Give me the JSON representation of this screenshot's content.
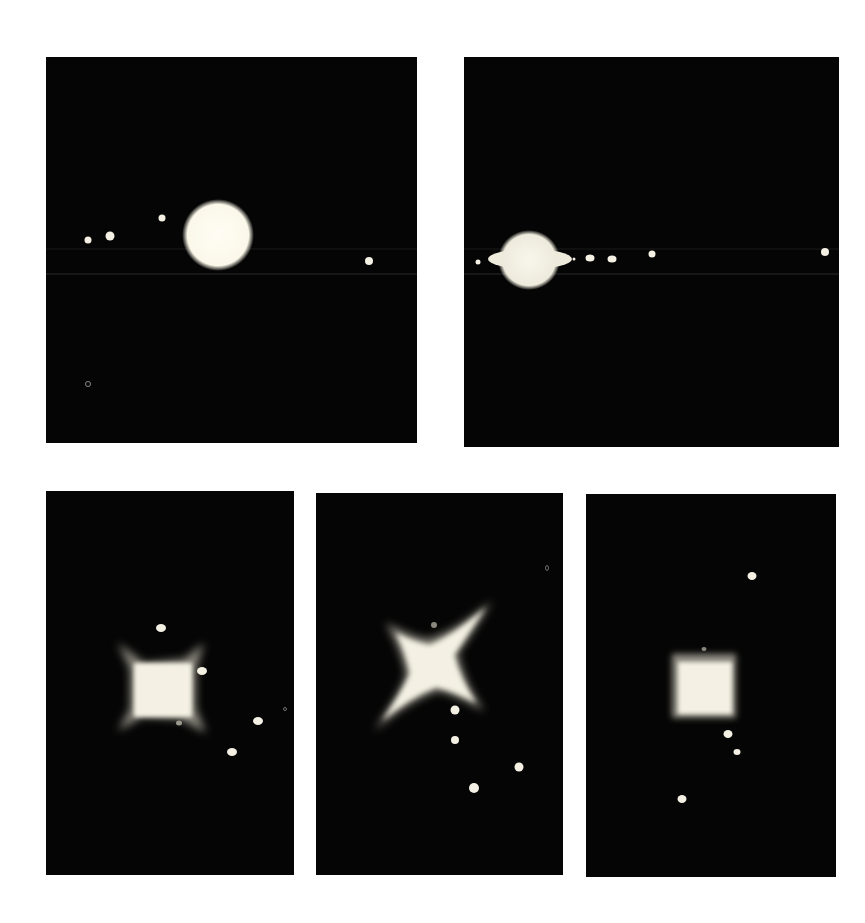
{
  "figure": {
    "background": "#ffffff",
    "panel_color": "#050505",
    "panels": [
      {
        "id": "top-left",
        "shape": "disk",
        "box": {
          "x": 46,
          "y": 57,
          "w": 371,
          "h": 386
        },
        "main_object": {
          "cx": 172,
          "cy": 178,
          "r": 33
        },
        "moons": [
          [
            42,
            183,
            3.5
          ],
          [
            64,
            179,
            4.5
          ],
          [
            116,
            161,
            3.5
          ],
          [
            323,
            204,
            4
          ]
        ],
        "scanlines": [
          192,
          217
        ]
      },
      {
        "id": "top-right",
        "shape": "ringed-planet",
        "box": {
          "x": 464,
          "y": 57,
          "w": 375,
          "h": 390
        },
        "main_object": {
          "cx": 63,
          "cy": 203
        },
        "moons": [
          [
            14,
            205,
            2.5
          ],
          [
            110,
            202,
            1.5
          ],
          [
            126,
            201,
            4
          ],
          [
            148,
            202,
            4
          ],
          [
            188,
            197,
            3.5
          ],
          [
            361,
            195,
            4
          ]
        ],
        "scanlines": [
          192,
          217
        ]
      },
      {
        "id": "bottom-left",
        "shape": "square-diffraction",
        "box": {
          "x": 46,
          "y": 491,
          "w": 248,
          "h": 384
        },
        "main_object": {
          "cx": 116,
          "cy": 197
        },
        "moons": [
          [
            115,
            137,
            4.5
          ],
          [
            156,
            180,
            4.5
          ],
          [
            212,
            230,
            4.5
          ],
          [
            186,
            261,
            4.5
          ],
          [
            133,
            232,
            3
          ]
        ]
      },
      {
        "id": "bottom-middle",
        "shape": "x-diffraction",
        "box": {
          "x": 316,
          "y": 493,
          "w": 247,
          "h": 382
        },
        "main_object": {
          "cx": 115,
          "cy": 165
        },
        "moons": [
          [
            139,
            217,
            4.5
          ],
          [
            139,
            247,
            4
          ],
          [
            203,
            274,
            4.5
          ],
          [
            158,
            295,
            5
          ],
          [
            118,
            132,
            3
          ]
        ]
      },
      {
        "id": "bottom-right",
        "shape": "small-square-diffraction",
        "box": {
          "x": 586,
          "y": 494,
          "w": 250,
          "h": 383
        },
        "main_object": {
          "cx": 118,
          "cy": 192
        },
        "moons": [
          [
            166,
            82,
            4.5
          ],
          [
            142,
            240,
            4.5
          ],
          [
            151,
            258,
            3.5
          ],
          [
            96,
            305,
            4.5
          ],
          [
            118,
            155,
            2.5
          ]
        ]
      }
    ]
  }
}
